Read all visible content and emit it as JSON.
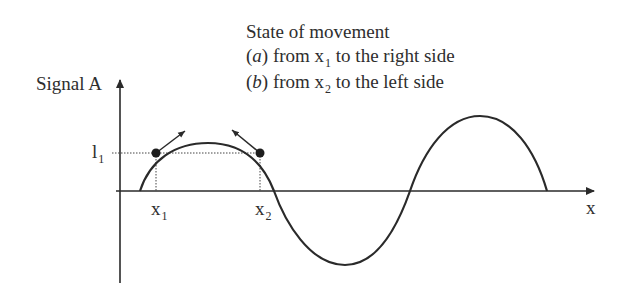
{
  "legend": {
    "title": "State of movement",
    "items": [
      {
        "tag": "a",
        "prefix": "from x",
        "sub": "1",
        "suffix": " to the right side"
      },
      {
        "tag": "b",
        "prefix": "from x",
        "sub": "2",
        "suffix": " to the left side"
      }
    ]
  },
  "axes": {
    "y_label": "Signal A",
    "x_label": "x",
    "level_label": "l",
    "level_sub": "1",
    "x1_label": "x",
    "x1_sub": "1",
    "x2_label": "x",
    "x2_sub": "2"
  },
  "colors": {
    "ink": "#2a2a2a",
    "background": "#ffffff"
  }
}
